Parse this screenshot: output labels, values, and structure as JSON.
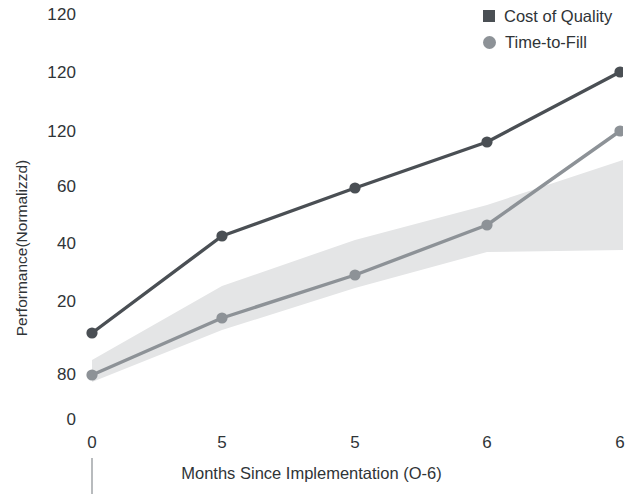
{
  "chart_data": {
    "type": "line",
    "title": "",
    "xlabel": "Months Since Implementation (O-6)",
    "ylabel": "Performance(Normalizzd)",
    "grid": false,
    "legend_position": "top-right",
    "x": [
      0,
      5,
      5,
      6,
      6
    ],
    "xtick_labels": [
      "0",
      "5",
      "5",
      "6",
      "6"
    ],
    "ytick_labels": [
      "120",
      "120",
      "120",
      "60",
      "40",
      "20",
      "80",
      "0"
    ],
    "ytick_values": [
      120,
      120,
      120,
      60,
      40,
      20,
      80,
      0
    ],
    "ylim": [
      0,
      140
    ],
    "series": [
      {
        "name": "Cost of Quality",
        "marker": "square",
        "color": "#4a4f54",
        "values": [
          18,
          43,
          60,
          76,
          120
        ],
        "pixel_points": [
          [
            92,
            333
          ],
          [
            222,
            236
          ],
          [
            355,
            188
          ],
          [
            487,
            142
          ],
          [
            620,
            72
          ]
        ]
      },
      {
        "name": "Time-to-Fill",
        "marker": "circle",
        "color": "#8d9297",
        "values": [
          8,
          15,
          29,
          47,
          119
        ],
        "pixel_points": [
          [
            92,
            375
          ],
          [
            222,
            318
          ],
          [
            355,
            275
          ],
          [
            487,
            225
          ],
          [
            620,
            131
          ]
        ],
        "band": {
          "label": "confidence band",
          "color": "#e4e5e6",
          "upper_pixels": [
            [
              92,
              360
            ],
            [
              222,
              286
            ],
            [
              355,
              240
            ],
            [
              487,
              205
            ],
            [
              623,
              160
            ]
          ],
          "lower_pixels": [
            [
              92,
              382
            ],
            [
              222,
              330
            ],
            [
              355,
              288
            ],
            [
              487,
              252
            ],
            [
              623,
              250
            ]
          ]
        }
      }
    ],
    "ytick_pixel_y": [
      14,
      72,
      131,
      186,
      243,
      301,
      374,
      419
    ],
    "xtick_pixel_x": [
      92,
      222,
      355,
      487,
      620
    ]
  },
  "legend": {
    "items": [
      {
        "label": "Cost of Quality",
        "marker": "square"
      },
      {
        "label": "Time-to-Fill",
        "marker": "circle"
      }
    ]
  },
  "axes": {
    "x_title": "Months Since Implementation (O-6)",
    "y_title": "Performance(Normalizzd)"
  }
}
